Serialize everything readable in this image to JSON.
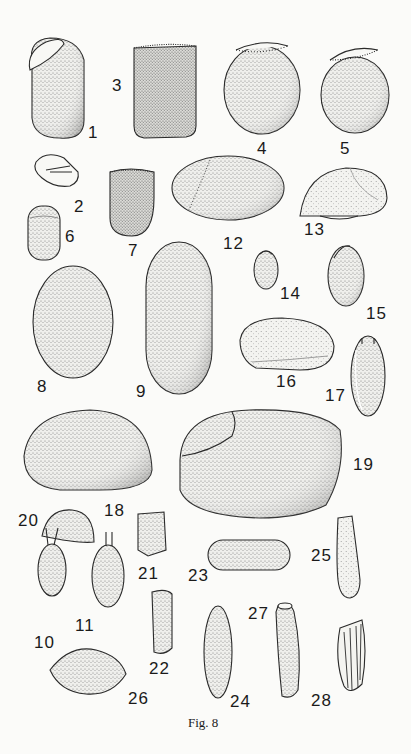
{
  "figure": {
    "caption": "Fig. 8",
    "specimens": [
      {
        "id": "1",
        "label": "1",
        "shape": "oblong egg with oblique operculum cap"
      },
      {
        "id": "2",
        "label": "2",
        "shape": "small egg with internal lines"
      },
      {
        "id": "3",
        "label": "3",
        "shape": "barrel-shaped, dense stipple, ciliated top rim"
      },
      {
        "id": "4",
        "label": "4",
        "shape": "oval with hatched operculum rim"
      },
      {
        "id": "5",
        "label": "5",
        "shape": "oval with hatched operculum rim"
      },
      {
        "id": "6",
        "label": "6",
        "shape": "small capsule"
      },
      {
        "id": "7",
        "label": "7",
        "shape": "small barrel with hatched rim"
      },
      {
        "id": "8",
        "label": "8",
        "shape": "large oval"
      },
      {
        "id": "9",
        "label": "9",
        "shape": "elongated oval"
      },
      {
        "id": "10",
        "label": "10",
        "shape": "small oval with two filaments"
      },
      {
        "id": "11",
        "label": "11",
        "shape": "oval with two filaments"
      },
      {
        "id": "12",
        "label": "12",
        "shape": "broad ellipse with dotted seam"
      },
      {
        "id": "13",
        "label": "13",
        "shape": "dome with flat base"
      },
      {
        "id": "14",
        "label": "14",
        "shape": "small bean with cap"
      },
      {
        "id": "15",
        "label": "15",
        "shape": "oblong with cap"
      },
      {
        "id": "16",
        "label": "16",
        "shape": "half-ellipse, sparsely stippled"
      },
      {
        "id": "17",
        "label": "17",
        "shape": "oblong with horn-like processes"
      },
      {
        "id": "18",
        "label": "18",
        "shape": "large dome"
      },
      {
        "id": "19",
        "label": "19",
        "shape": "large egg with operculum"
      },
      {
        "id": "20",
        "label": "20",
        "shape": "small half-dome"
      },
      {
        "id": "21",
        "label": "21",
        "shape": "small rectangular prism"
      },
      {
        "id": "22",
        "label": "22",
        "shape": "narrow rectangular prism"
      },
      {
        "id": "23",
        "label": "23",
        "shape": "capsule"
      },
      {
        "id": "24",
        "label": "24",
        "shape": "elongated oval with hatched tip"
      },
      {
        "id": "25",
        "label": "25",
        "shape": "club-shaped"
      },
      {
        "id": "26",
        "label": "26",
        "shape": "lemon/spindle shape"
      },
      {
        "id": "27",
        "label": "27",
        "shape": "curved elongate with opening"
      },
      {
        "id": "28",
        "label": "28",
        "shape": "ribbed oblong"
      }
    ]
  },
  "colors": {
    "background": "#fbfbf9",
    "ink": "#1a1a1a",
    "stipple": "#6f6f6f"
  }
}
